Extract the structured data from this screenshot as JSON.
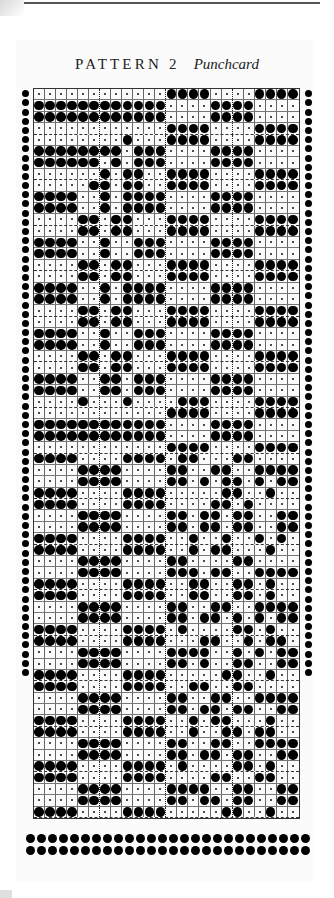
{
  "title": {
    "main": "PATTERN 2",
    "sub": "Punchcard"
  },
  "card": {
    "columns": 24,
    "legend": {
      "1": "punched hole",
      "0": "unpunched (dot)"
    },
    "dotted_column_dividers_after": [
      6,
      12,
      18
    ],
    "rows": [
      "000000000000111100001111",
      "111111111111000011110000",
      "111111111111000011110000",
      "000000000000111100001111",
      "000000001000111100001111",
      "111111110111000011110000",
      "111111010111000011110000",
      "000000101100111100001111",
      "000001101100111100001111",
      "111100101111000011110000",
      "111100101111000011110000",
      "000011011000111100001111",
      "000011011000111100001111",
      "111100100111000011110000",
      "111100100111000011110000",
      "000011011000111100001111",
      "000011011000111100001111",
      "111100101111000011110000",
      "111100101111000011110000",
      "000011011000111100001111",
      "000011011000111100001111",
      "111100100111000011110000",
      "111100100111000011110000",
      "000011011000111100001111",
      "000011011000111100001111",
      "111100110111000011110000",
      "111100110111000011110000",
      "000010001000011100001111",
      "000000000000111100001111",
      "111111111111000011110000",
      "111111111111000011110000",
      "000000000000111100001111",
      "111100001111011000110000",
      "000011110000110011001111",
      "000011110000110101101011",
      "111100001111000001100100",
      "111100001111000011010000",
      "000011110000110110110011",
      "000011110000110110110011",
      "111100001111001001001010",
      "111100001111001011000100",
      "000011110000110000110000",
      "000011110000111011001111",
      "111100001111001100110100",
      "111100001111001100110100",
      "000011110000110011001111",
      "000011110000110110101011",
      "111100001111010000110100",
      "111100001111000110010110",
      "000011110000111100101011",
      "000011110000110100110011",
      "111100001111000001100100",
      "111100001111001100110000",
      "000011110000110011001111",
      "000011110000110110110011",
      "111100001111001011000100",
      "111100001111001001101100",
      "000011110000110011001111",
      "000011110000110110110011",
      "111100001111010000110100",
      "111100001111000011001100",
      "000011110000111100110011",
      "000011110000110110110011",
      "111100001111000001100100"
    ]
  },
  "border": {
    "side_holes_per_column": 64,
    "bottom_rows": 2,
    "bottom_holes_per_row": 26
  },
  "colors": {
    "ink": "#000000",
    "paper": "#fbfbfb",
    "grid": "#666666"
  }
}
